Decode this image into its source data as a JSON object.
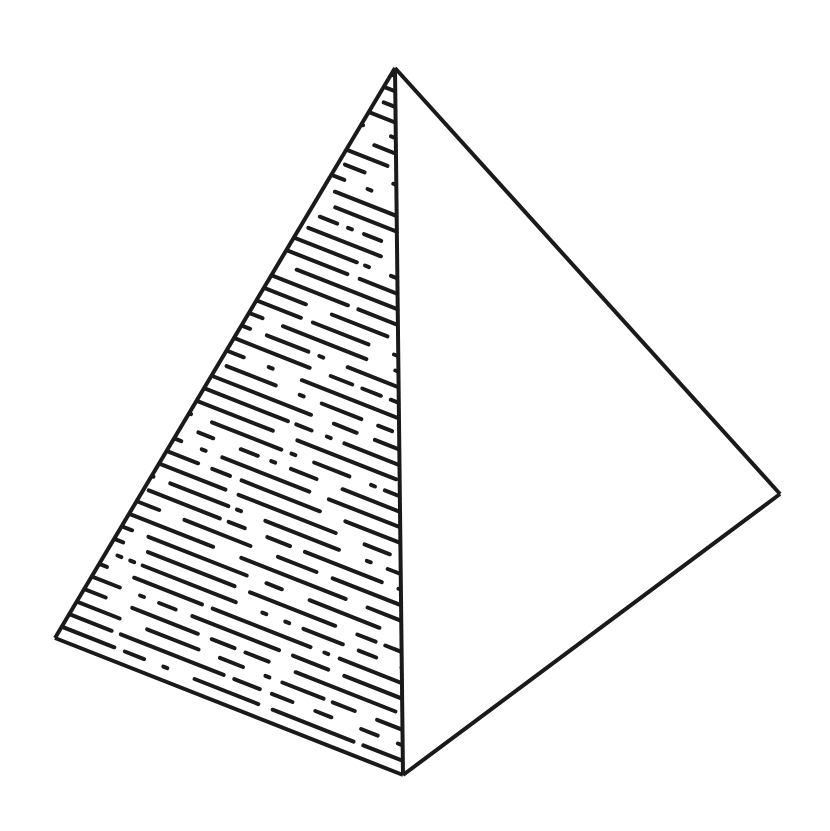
{
  "figure": {
    "colors": {
      "ink": "#1a1a1a",
      "background": "#ffffff"
    },
    "vertices": {
      "apex": [
        395,
        68
      ],
      "left": [
        55,
        638
      ],
      "front_bottom": [
        403,
        775
      ],
      "right": [
        780,
        494
      ]
    },
    "faces": [
      {
        "name": "left-face",
        "shading": "dashed-hatching"
      },
      {
        "name": "right-face",
        "shading": "none"
      }
    ]
  }
}
